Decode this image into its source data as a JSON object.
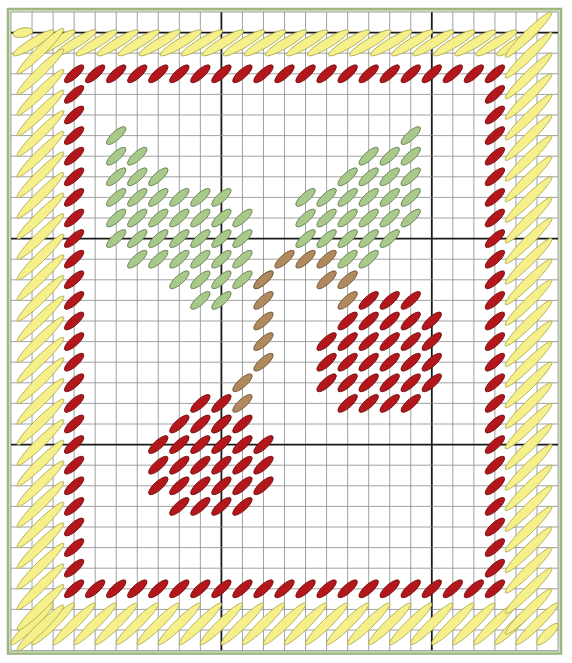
{
  "pattern": {
    "title": "Cherry needlepoint chart",
    "grid": {
      "cols": 26,
      "rows": 31,
      "origin_x": 11,
      "origin_y": 12,
      "cell_w": 21.04,
      "cell_h": 20.6,
      "thick_every": 10,
      "thick_col_offset": 0,
      "thick_row_offset": 1,
      "thin_color": "#8a8a8a",
      "thick_color": "#1a1a1a"
    },
    "frame": {
      "color": "#9cb87e",
      "inner_color": "#b9cf9f"
    },
    "colors": {
      "border_yellow": {
        "fill": "#f6f08a",
        "stroke": "#a9a64e"
      },
      "red": {
        "fill": "#b3161b",
        "stroke": "#6e0d0f"
      },
      "leaf_green": {
        "fill": "#a8c98a",
        "stroke": "#5f7a4a"
      },
      "stem_brown": {
        "fill": "#b08a5e",
        "stroke": "#6d5232"
      }
    },
    "legend": [
      {
        "name": "Yellow border (long slanted stitches)",
        "color": "#f6f08a"
      },
      {
        "name": "Red frame and cherries",
        "color": "#b3161b"
      },
      {
        "name": "Green leaves",
        "color": "#a8c98a"
      },
      {
        "name": "Brown stems",
        "color": "#b08a5e"
      }
    ],
    "red_border": {
      "col_min": 3,
      "col_max": 23,
      "row_min": 3,
      "row_max": 28
    },
    "leaves": {
      "left": [
        [
          5,
          6
        ],
        [
          5,
          7
        ],
        [
          6,
          7
        ],
        [
          5,
          8
        ],
        [
          6,
          8
        ],
        [
          7,
          8
        ],
        [
          5,
          9
        ],
        [
          6,
          9
        ],
        [
          7,
          9
        ],
        [
          8,
          9
        ],
        [
          9,
          9
        ],
        [
          10,
          9
        ],
        [
          5,
          10
        ],
        [
          6,
          10
        ],
        [
          7,
          10
        ],
        [
          8,
          10
        ],
        [
          9,
          10
        ],
        [
          10,
          10
        ],
        [
          11,
          10
        ],
        [
          5,
          11
        ],
        [
          6,
          11
        ],
        [
          7,
          11
        ],
        [
          8,
          11
        ],
        [
          9,
          11
        ],
        [
          10,
          11
        ],
        [
          11,
          11
        ],
        [
          6,
          12
        ],
        [
          7,
          12
        ],
        [
          8,
          12
        ],
        [
          9,
          12
        ],
        [
          10,
          12
        ],
        [
          11,
          12
        ],
        [
          8,
          13
        ],
        [
          9,
          13
        ],
        [
          10,
          13
        ],
        [
          11,
          13
        ],
        [
          12,
          13
        ],
        [
          9,
          14
        ],
        [
          10,
          14
        ]
      ],
      "right": [
        [
          19,
          6
        ],
        [
          17,
          7
        ],
        [
          18,
          7
        ],
        [
          19,
          7
        ],
        [
          16,
          8
        ],
        [
          17,
          8
        ],
        [
          18,
          8
        ],
        [
          19,
          8
        ],
        [
          14,
          9
        ],
        [
          15,
          9
        ],
        [
          16,
          9
        ],
        [
          17,
          9
        ],
        [
          18,
          9
        ],
        [
          19,
          9
        ],
        [
          14,
          10
        ],
        [
          15,
          10
        ],
        [
          16,
          10
        ],
        [
          17,
          10
        ],
        [
          18,
          10
        ],
        [
          19,
          10
        ],
        [
          14,
          11
        ],
        [
          15,
          11
        ],
        [
          16,
          11
        ],
        [
          17,
          11
        ],
        [
          18,
          11
        ],
        [
          16,
          12
        ],
        [
          17,
          12
        ]
      ]
    },
    "stems": [
      [
        13,
        12
      ],
      [
        14,
        12
      ],
      [
        15,
        12
      ],
      [
        12,
        13
      ],
      [
        15,
        13
      ],
      [
        16,
        13
      ],
      [
        16,
        14
      ],
      [
        12,
        14
      ],
      [
        12,
        15
      ],
      [
        12,
        16
      ],
      [
        12,
        17
      ],
      [
        11,
        18
      ],
      [
        11,
        19
      ],
      [
        10,
        20
      ]
    ],
    "cherries": {
      "right": [
        [
          17,
          14
        ],
        [
          18,
          14
        ],
        [
          19,
          14
        ],
        [
          16,
          15
        ],
        [
          17,
          15
        ],
        [
          18,
          15
        ],
        [
          19,
          15
        ],
        [
          20,
          15
        ],
        [
          15,
          16
        ],
        [
          16,
          16
        ],
        [
          17,
          16
        ],
        [
          18,
          16
        ],
        [
          19,
          16
        ],
        [
          20,
          16
        ],
        [
          15,
          17
        ],
        [
          16,
          17
        ],
        [
          17,
          17
        ],
        [
          18,
          17
        ],
        [
          19,
          17
        ],
        [
          20,
          17
        ],
        [
          15,
          18
        ],
        [
          16,
          18
        ],
        [
          17,
          18
        ],
        [
          18,
          18
        ],
        [
          19,
          18
        ],
        [
          20,
          18
        ],
        [
          16,
          19
        ],
        [
          17,
          19
        ],
        [
          18,
          19
        ],
        [
          19,
          19
        ]
      ],
      "left": [
        [
          9,
          19
        ],
        [
          10,
          19
        ],
        [
          8,
          20
        ],
        [
          9,
          20
        ],
        [
          10,
          20
        ],
        [
          11,
          20
        ],
        [
          7,
          21
        ],
        [
          8,
          21
        ],
        [
          9,
          21
        ],
        [
          10,
          21
        ],
        [
          11,
          21
        ],
        [
          12,
          21
        ],
        [
          7,
          22
        ],
        [
          8,
          22
        ],
        [
          9,
          22
        ],
        [
          10,
          22
        ],
        [
          11,
          22
        ],
        [
          12,
          22
        ],
        [
          7,
          23
        ],
        [
          8,
          23
        ],
        [
          9,
          23
        ],
        [
          10,
          23
        ],
        [
          11,
          23
        ],
        [
          12,
          23
        ],
        [
          8,
          24
        ],
        [
          9,
          24
        ],
        [
          10,
          24
        ],
        [
          11,
          24
        ]
      ]
    }
  }
}
